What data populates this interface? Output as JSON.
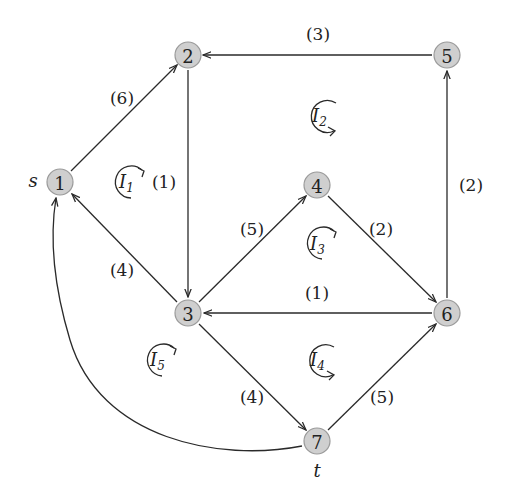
{
  "diagram": {
    "type": "directed flow network",
    "source_label": "s",
    "sink_label": "t",
    "nodes": [
      {
        "id": "1",
        "label": "1",
        "x": 60,
        "y": 182
      },
      {
        "id": "2",
        "label": "2",
        "x": 188,
        "y": 55
      },
      {
        "id": "3",
        "label": "3",
        "x": 188,
        "y": 313
      },
      {
        "id": "4",
        "label": "4",
        "x": 317,
        "y": 185
      },
      {
        "id": "5",
        "label": "5",
        "x": 447,
        "y": 55
      },
      {
        "id": "6",
        "label": "6",
        "x": 447,
        "y": 313
      },
      {
        "id": "7",
        "label": "7",
        "x": 317,
        "y": 441
      }
    ],
    "edges": [
      {
        "from": "1",
        "to": "2",
        "weight": "(6)"
      },
      {
        "from": "5",
        "to": "2",
        "weight": "(3)"
      },
      {
        "from": "2",
        "to": "3",
        "weight": "(1)"
      },
      {
        "from": "6",
        "to": "5",
        "weight": "(2)"
      },
      {
        "from": "3",
        "to": "1",
        "weight": "(4)"
      },
      {
        "from": "3",
        "to": "4",
        "weight": "(5)"
      },
      {
        "from": "4",
        "to": "6",
        "weight": "(2)"
      },
      {
        "from": "6",
        "to": "3",
        "weight": "(1)"
      },
      {
        "from": "3",
        "to": "7",
        "weight": "(4)"
      },
      {
        "from": "7",
        "to": "6",
        "weight": "(5)"
      },
      {
        "from": "7",
        "to": "1",
        "weight": ""
      }
    ],
    "loops": [
      {
        "name": "I",
        "sub": "1",
        "direction": "clockwise"
      },
      {
        "name": "I",
        "sub": "2",
        "direction": "counterclockwise"
      },
      {
        "name": "I",
        "sub": "3",
        "direction": "clockwise"
      },
      {
        "name": "I",
        "sub": "4",
        "direction": "counterclockwise"
      },
      {
        "name": "I",
        "sub": "5",
        "direction": "clockwise"
      }
    ]
  }
}
